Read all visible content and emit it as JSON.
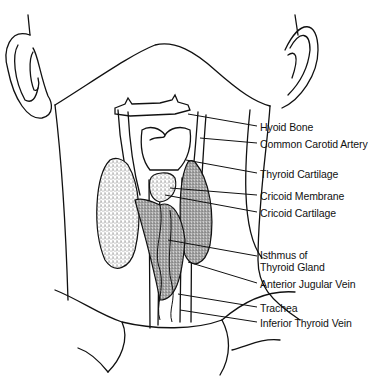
{
  "figure": {
    "colors": {
      "ink": "#111111",
      "background": "#ffffff",
      "stipple": "#555555"
    }
  },
  "labels": [
    {
      "id": "hyoid-bone",
      "text": "Hyoid Bone"
    },
    {
      "id": "common-carotid-artery",
      "text": "Common Carotid Artery"
    },
    {
      "id": "thyroid-cartilage",
      "text": "Thyroid Cartilage"
    },
    {
      "id": "cricoid-membrane",
      "text": "Cricoid Membrane"
    },
    {
      "id": "cricoid-cartilage",
      "text": "Cricoid Cartilage"
    },
    {
      "id": "isthmus-line1",
      "text": "Isthmus of"
    },
    {
      "id": "isthmus-line2",
      "text": "Thyroid Gland"
    },
    {
      "id": "anterior-jugular-vein",
      "text": "Anterior Jugular Vein"
    },
    {
      "id": "trachea",
      "text": "Trachea"
    },
    {
      "id": "inferior-thyroid-vein",
      "text": "Inferior Thyroid Vein"
    }
  ]
}
